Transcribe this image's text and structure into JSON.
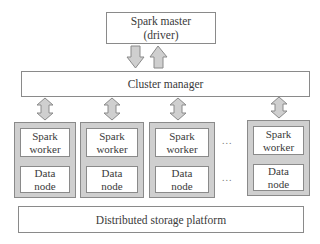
{
  "diagram": {
    "master": {
      "label": "Spark master\n(driver)"
    },
    "cluster_manager": {
      "label": "Cluster manager"
    },
    "workers": [
      {
        "worker_label": "Spark\nworker",
        "node_label": "Data\nnode"
      },
      {
        "worker_label": "Spark\nworker",
        "node_label": "Data\nnode"
      },
      {
        "worker_label": "Spark\nworker",
        "node_label": "Data\nnode"
      },
      {
        "worker_label": "Spark\nworker",
        "node_label": "Data\nnode"
      }
    ],
    "ellipsis": "...",
    "storage": {
      "label": "Distributed storage platform"
    },
    "colors": {
      "arrow_fill": "#cfcfcf",
      "arrow_stroke": "#8a8a8a",
      "worker_bg": "#cfcfcf",
      "border": "#8a8a8a"
    }
  }
}
